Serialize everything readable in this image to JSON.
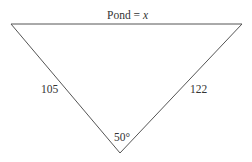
{
  "diagram": {
    "type": "triangle",
    "top_label_prefix": "Pond = ",
    "top_label_var": "x",
    "left_side": "105",
    "right_side": "122",
    "bottom_angle": "50°",
    "line_color": "#555555"
  }
}
